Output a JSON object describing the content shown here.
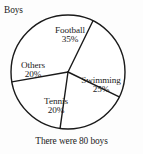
{
  "figure": {
    "title": "Boys",
    "caption": "There were 80 boys",
    "background_color": "#fdfdfd",
    "stroke_color": "#1a1a1a",
    "text_color": "#1c1c1c"
  },
  "chart_data": {
    "type": "pie",
    "title": "Boys",
    "subtitle": "",
    "xlabel": "",
    "ylabel": "",
    "total_label": "There were 80 boys",
    "total": 80,
    "units": "boys",
    "grid": false,
    "legend": "none",
    "labels_inside_slices": true,
    "categories": [
      "Football",
      "Swimming",
      "Tennis",
      "Others"
    ],
    "values": [
      35,
      25,
      20,
      20
    ],
    "value_suffix": "%",
    "counts": [
      28,
      20,
      16,
      16
    ],
    "slices": [
      {
        "name": "Football",
        "label": "Football",
        "percent": 35,
        "percent_text": "35%",
        "count": 28,
        "angle_deg": 126,
        "start_deg": -100,
        "end_deg": 26,
        "color": "#ffffff"
      },
      {
        "name": "Swimming",
        "label": "Swimming",
        "percent": 25,
        "percent_text": "25%",
        "count": 20,
        "angle_deg": 90,
        "start_deg": 26,
        "end_deg": 116,
        "color": "#ffffff"
      },
      {
        "name": "Tennis",
        "label": "Tennis",
        "percent": 20,
        "percent_text": "20%",
        "count": 16,
        "angle_deg": 72,
        "start_deg": 116,
        "end_deg": 188,
        "color": "#ffffff"
      },
      {
        "name": "Others",
        "label": "Others",
        "percent": 20,
        "percent_text": "20%",
        "count": 16,
        "angle_deg": 72,
        "start_deg": 188,
        "end_deg": 260,
        "color": "#ffffff"
      }
    ],
    "geometry": {
      "center_x": 68,
      "center_y": 72,
      "radius": 57
    }
  }
}
